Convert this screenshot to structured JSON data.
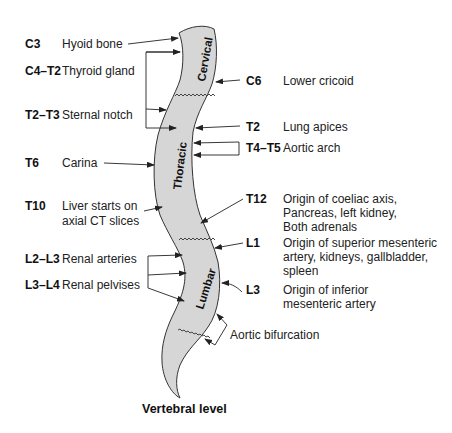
{
  "diagram": {
    "title": "Vertebral level",
    "regions": [
      {
        "name": "Cervical"
      },
      {
        "name": "Thoracic"
      },
      {
        "name": "Lumbar"
      }
    ],
    "left_labels": [
      {
        "level": "C3",
        "description": [
          "Hyoid bone"
        ]
      },
      {
        "level": "C4–T2",
        "description": [
          "Thyroid gland"
        ]
      },
      {
        "level": "T2–T3",
        "description": [
          "Sternal notch"
        ]
      },
      {
        "level": "T6",
        "description": [
          "Carina"
        ]
      },
      {
        "level": "T10",
        "description": [
          "Liver starts on",
          "axial CT slices"
        ]
      },
      {
        "level": "L2–L3",
        "description": [
          "Renal arteries"
        ]
      },
      {
        "level": "L3–L4",
        "description": [
          "Renal pelvises"
        ]
      }
    ],
    "right_labels": [
      {
        "level": "C6",
        "description": [
          "Lower cricoid"
        ]
      },
      {
        "level": "T2",
        "description": [
          "Lung apices"
        ]
      },
      {
        "level": "T4–T5",
        "description": [
          "Aortic arch"
        ]
      },
      {
        "level": "T12",
        "description": [
          "Origin of coeliac axis,",
          "Pancreas, left kidney,",
          "Both adrenals"
        ]
      },
      {
        "level": "L1",
        "description": [
          "Origin of superior mesenteric",
          "artery, kidneys, gallbladder,",
          "spleen"
        ]
      },
      {
        "level": "L3",
        "description": [
          "Origin of inferior",
          "mesenteric artery"
        ]
      }
    ],
    "bottom_labels": [
      {
        "level": "",
        "description": [
          "Aortic bifurcation"
        ]
      }
    ],
    "colors": {
      "spine_fill": "#d6d6d6",
      "outline": "#333333",
      "text": "#1a1a1a"
    }
  }
}
